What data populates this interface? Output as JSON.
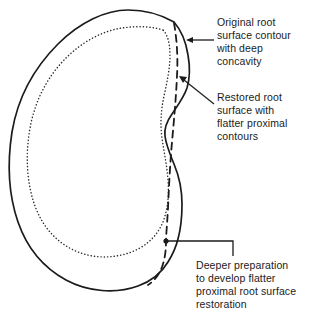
{
  "figure": {
    "background_color": "#ffffff",
    "line_color": "#1b1b1b",
    "text_color": "#1b1b1b"
  },
  "callouts": {
    "original": {
      "text": "Original root\nsurface contour\nwith deep\nconcavity",
      "lines": [
        "Original root",
        "surface contour",
        "with deep",
        "concavity"
      ],
      "leader": "horizontal-line-with-arrowhead",
      "points_to": "outer-solid-root-contour"
    },
    "restored": {
      "text": "Restored root\nsurface with\nflatter proximal\ncontours",
      "lines": [
        "Restored root",
        "surface with",
        "flatter proximal",
        "contours"
      ],
      "leader": "diagonal-line-with-arrowhead",
      "points_to": "dashed-restored-contour"
    },
    "deeper": {
      "text": "Deeper preparation\nto develop flatter\nproximal root surface\nrestoration",
      "lines": [
        "Deeper preparation",
        "to develop flatter",
        "proximal root surface",
        "restoration"
      ],
      "leader": "elbow-line-with-dot",
      "points_to": "dashed-preparation-start-point"
    }
  },
  "shapes": {
    "outer_contour": {
      "name": "original-root-surface-contour",
      "style": "solid",
      "stroke_width": 1.7,
      "description": "Outer solid kidney-shaped root cross-section outline with a deep concavity on the right proximal surface"
    },
    "inner_contour": {
      "name": "pulp-chamber-contour",
      "style": "dotted",
      "stroke_width": 1.5,
      "description": "Inner dotted outline following the outer contour, representing internal anatomy"
    },
    "restored_contour": {
      "name": "restored-root-surface",
      "style": "dashed",
      "stroke_width": 1.8,
      "description": "Dashed line bridging across the concavity showing the flatter restored proximal contour"
    },
    "preparation_dot": {
      "name": "preparation-start-marker",
      "style": "filled-circle",
      "radius": 2.6,
      "x": 166,
      "y": 241
    }
  }
}
